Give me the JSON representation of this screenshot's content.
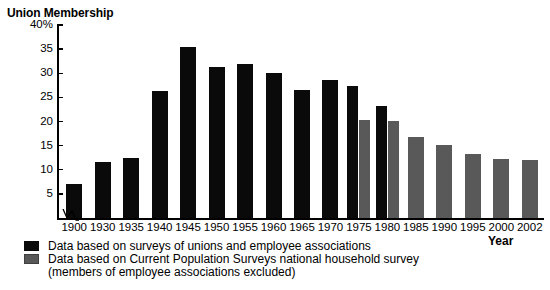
{
  "top_sliver_text": "",
  "chart_data": {
    "type": "bar",
    "title": "Union Membership",
    "xlabel": "Year",
    "ylabel": "",
    "ylim": [
      0,
      40
    ],
    "ytick_values": [
      40,
      35,
      30,
      25,
      20,
      15,
      10,
      5
    ],
    "ytick_labels": [
      "40%",
      "35",
      "30",
      "25",
      "20",
      "15",
      "10",
      "5"
    ],
    "grid": false,
    "axis_break": {
      "present": true,
      "between": [
        "1900",
        "1930"
      ],
      "note": "zigzag break in x-axis between 1900 and 1930"
    },
    "categories": [
      "1900",
      "1930",
      "1935",
      "1940",
      "1945",
      "1950",
      "1955",
      "1960",
      "1965",
      "1970",
      "1975",
      "1980",
      "1985",
      "1990",
      "1995",
      "2000",
      "2002"
    ],
    "series": [
      {
        "name": "Data based on surveys of unions and employee associations",
        "color": "#0a0a0a",
        "values": [
          7.0,
          11.6,
          12.4,
          26.4,
          35.4,
          31.2,
          31.9,
          30.0,
          26.6,
          28.6,
          27.4,
          23.2,
          null,
          null,
          null,
          null,
          null
        ]
      },
      {
        "name": "Data based on Current Population Surveys national household survey (members of employee associations excluded)",
        "color": "#595959",
        "values": [
          null,
          null,
          null,
          null,
          null,
          null,
          null,
          null,
          null,
          null,
          20.3,
          20.1,
          16.7,
          15.2,
          13.3,
          12.2,
          12.0
        ]
      }
    ],
    "legend": {
      "position": "below-axis",
      "entries": [
        {
          "swatch": "black",
          "label": "Data based on surveys of unions and employee associations"
        },
        {
          "swatch": "gray",
          "label": "Data based on Current Population Surveys national household survey"
        }
      ],
      "note_line": "(members of employee associations excluded)"
    }
  }
}
